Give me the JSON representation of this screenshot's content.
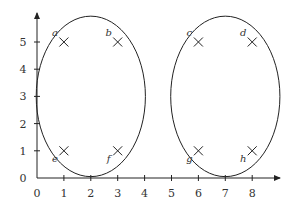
{
  "diagram": {
    "type": "scatter-with-clusters",
    "x_axis": {
      "ticks": [
        "0",
        "1",
        "2",
        "3",
        "4",
        "5",
        "6",
        "7",
        "8"
      ],
      "range": [
        0,
        8
      ]
    },
    "y_axis": {
      "ticks": [
        "0",
        "1",
        "2",
        "3",
        "4",
        "5"
      ],
      "range": [
        0,
        5
      ]
    },
    "points": [
      {
        "label": "a",
        "x": 1,
        "y": 5
      },
      {
        "label": "b",
        "x": 3,
        "y": 5
      },
      {
        "label": "c",
        "x": 6,
        "y": 5
      },
      {
        "label": "d",
        "x": 8,
        "y": 5
      },
      {
        "label": "e",
        "x": 1,
        "y": 1
      },
      {
        "label": "f",
        "x": 3,
        "y": 1
      },
      {
        "label": "g",
        "x": 6,
        "y": 1
      },
      {
        "label": "h",
        "x": 8,
        "y": 1
      }
    ],
    "clusters": [
      {
        "name": "left-cluster",
        "members": [
          "a",
          "b",
          "e",
          "f"
        ],
        "center": [
          2,
          3
        ]
      },
      {
        "name": "right-cluster",
        "members": [
          "c",
          "d",
          "g",
          "h"
        ],
        "center": [
          7,
          3
        ]
      }
    ],
    "colors": {
      "stroke": "#222222",
      "text": "#333333"
    }
  }
}
